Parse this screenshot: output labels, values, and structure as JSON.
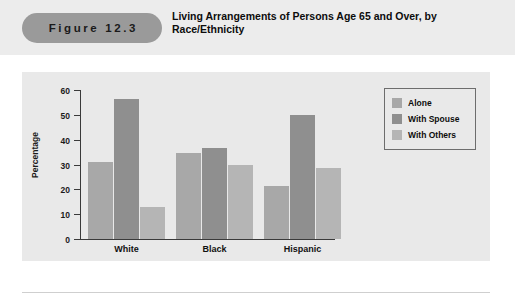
{
  "header": {
    "figure_label": "Figure 12.3",
    "title": "Living Arrangements of Persons Age 65 and Over, by Race/Ethnicity",
    "band_color": "#ececec",
    "pill_color": "#9a9a9a"
  },
  "chart_data": {
    "type": "bar",
    "title": "Living Arrangements of Persons Age 65 and Over, by Race/Ethnicity",
    "xlabel": "",
    "ylabel": "Percentage",
    "ylim": [
      0,
      60
    ],
    "yticks": [
      0,
      10,
      20,
      30,
      40,
      50,
      60
    ],
    "ytick_labels": [
      "0",
      "10",
      "20",
      "30",
      "40",
      "50",
      "60"
    ],
    "categories": [
      "White",
      "Black",
      "Hispanic"
    ],
    "grid": false,
    "legend_position": "top-right",
    "series": [
      {
        "name": "Alone",
        "color": "#a8a8a8",
        "values": [
          31,
          34.5,
          21.5
        ]
      },
      {
        "name": "With Spouse",
        "color": "#8f8f8f",
        "values": [
          56.5,
          36.5,
          50
        ]
      },
      {
        "name": "With Others",
        "color": "#b5b5b5",
        "values": [
          13,
          30,
          28.5
        ]
      }
    ],
    "panel_color": "#e9e9e9"
  }
}
